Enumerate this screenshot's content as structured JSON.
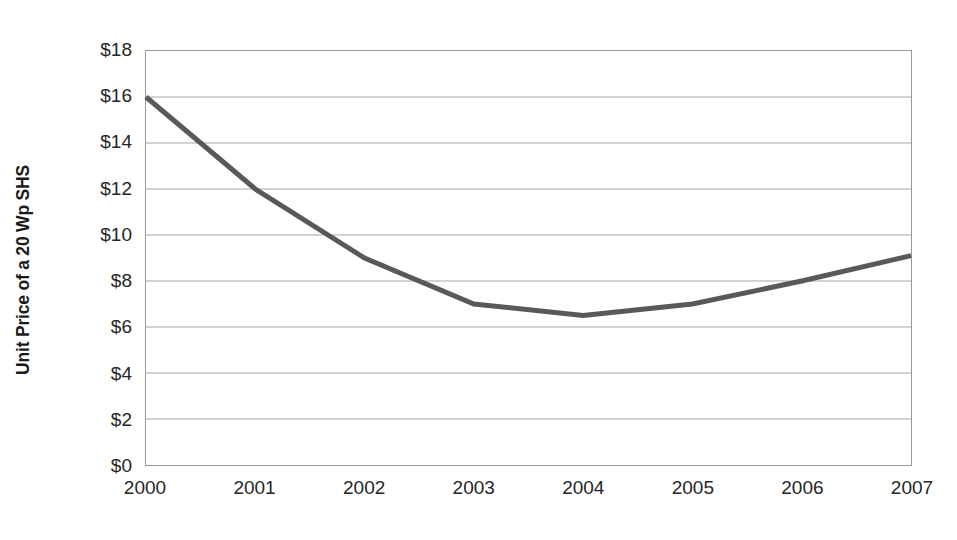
{
  "chart_data": {
    "type": "line",
    "title": "",
    "subtitle": "",
    "xlabel": "",
    "ylabel": "Unit Price of a 20 Wp SHS",
    "categories": [
      "2000",
      "2001",
      "2002",
      "2003",
      "2004",
      "2005",
      "2006",
      "2007"
    ],
    "x": [
      2000,
      2001,
      2002,
      2003,
      2004,
      2005,
      2006,
      2007
    ],
    "series": [
      {
        "name": "Unit Price of a 20 Wp SHS",
        "values": [
          16.0,
          12.0,
          9.0,
          7.0,
          6.5,
          7.0,
          8.0,
          9.1
        ],
        "color": "#595959"
      }
    ],
    "ylim": [
      0,
      18
    ],
    "xlim": [
      2000,
      2007
    ],
    "ytick_values": [
      18,
      16,
      14,
      12,
      10,
      8,
      6,
      4,
      2,
      0
    ],
    "ytick_labels": [
      "$18",
      "$16",
      "$14",
      "$12",
      "$10",
      "$8",
      "$6",
      "$4",
      "$2",
      "$0"
    ],
    "xtick_labels": [
      "2000",
      "2001",
      "2002",
      "2003",
      "2004",
      "2005",
      "2006",
      "2007"
    ],
    "grid": {
      "horizontal": true,
      "vertical": false,
      "color": "#a6a6a6"
    },
    "legend": {
      "visible": false,
      "position": "none",
      "entries": []
    },
    "annotations": [],
    "plot_border": true,
    "markers": false,
    "line_width": 5,
    "background": "#ffffff"
  },
  "axes": {
    "y_title": "Unit Price of a 20 Wp SHS"
  }
}
